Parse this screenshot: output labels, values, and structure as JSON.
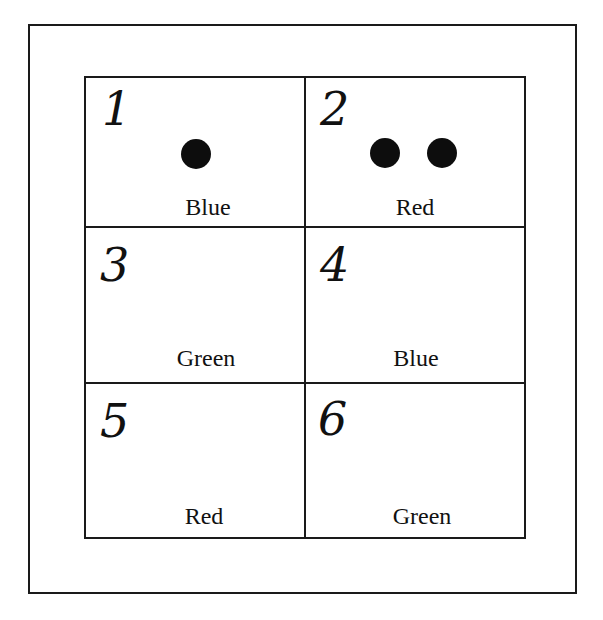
{
  "diagram": {
    "type": "grid",
    "rows": 3,
    "columns": 2,
    "cells": [
      {
        "number": "1",
        "label": "Blue",
        "dots": 1
      },
      {
        "number": "2",
        "label": "Red",
        "dots": 2
      },
      {
        "number": "3",
        "label": "Green",
        "dots": 0
      },
      {
        "number": "4",
        "label": "Blue",
        "dots": 0
      },
      {
        "number": "5",
        "label": "Red",
        "dots": 0
      },
      {
        "number": "6",
        "label": "Green",
        "dots": 0
      }
    ],
    "colors": {
      "line": "#1a1a1a",
      "dot": "#0d0d0d",
      "background": "#ffffff"
    }
  }
}
